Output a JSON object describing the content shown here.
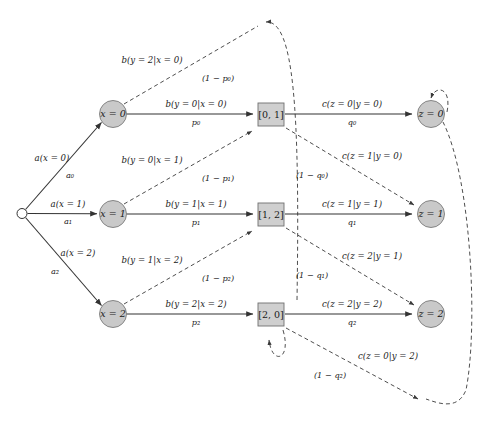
{
  "figure": {
    "title": "",
    "type": "trellis-transition-diagram"
  },
  "nodes": {
    "start": {
      "name": "start-node",
      "label": "",
      "cx": 22,
      "cy": 213.5,
      "r": 5
    },
    "states": [
      {
        "id": "x0",
        "label": "x = 0",
        "cx": 113,
        "cy": 114,
        "r": 13.5
      },
      {
        "id": "x1",
        "label": "x = 1",
        "cx": 113,
        "cy": 214,
        "r": 13.5
      },
      {
        "id": "x2",
        "label": "x = 2",
        "cx": 113,
        "cy": 314,
        "r": 13.5
      }
    ],
    "boxes": [
      {
        "id": "b01",
        "label": "[0, 1]",
        "x": 258,
        "y": 103,
        "w": 26,
        "h": 23
      },
      {
        "id": "b12",
        "label": "[1, 2]",
        "x": 258,
        "y": 203,
        "w": 26,
        "h": 23
      },
      {
        "id": "b20",
        "label": "[2, 0]",
        "x": 258,
        "y": 303,
        "w": 26,
        "h": 23
      }
    ],
    "outputs": [
      {
        "id": "z0",
        "label": "z = 0",
        "cx": 431,
        "cy": 114,
        "r": 13.5
      },
      {
        "id": "z1",
        "label": "z = 1",
        "cx": 431,
        "cy": 214,
        "r": 13.5
      },
      {
        "id": "z2",
        "label": "z = 2",
        "cx": 431,
        "cy": 314,
        "r": 13.5
      }
    ]
  },
  "edges": {
    "prior": [
      {
        "id": "a0",
        "top": "a(x = 0)",
        "bottom": "a₀",
        "top_x": 52,
        "top_y": 158,
        "bot_x": 70,
        "bot_y": 176
      },
      {
        "id": "a1",
        "top": "a(x = 1)",
        "bottom": "a₁",
        "top_x": 68,
        "top_y": 204,
        "bot_x": 68,
        "bot_y": 222
      },
      {
        "id": "a2",
        "top": "a(x = 2)",
        "bottom": "a₂",
        "top_x": 78,
        "top_y": 253,
        "bot_x": 55,
        "bot_y": 272
      }
    ],
    "emission_solid": [
      {
        "id": "b_y0_x0",
        "top": "b(y = 0|x = 0)",
        "bottom": "p₀",
        "top_x": 196,
        "top_y": 104,
        "bot_x": 196,
        "bot_y": 123
      },
      {
        "id": "b_y1_x1",
        "top": "b(y = 1|x = 1)",
        "bottom": "p₁",
        "top_x": 196,
        "top_y": 204,
        "bot_x": 196,
        "bot_y": 223
      },
      {
        "id": "b_y2_x2",
        "top": "b(y = 2|x = 2)",
        "bottom": "p₂",
        "top_x": 196,
        "top_y": 304,
        "bot_x": 196,
        "bot_y": 323
      }
    ],
    "emission_dashed": [
      {
        "id": "b_y2_x0",
        "top": "b(y = 2|x = 0)",
        "bottom": "(1 − p₀)",
        "top_x": 152,
        "top_y": 60,
        "bot_x": 218,
        "bot_y": 79
      },
      {
        "id": "b_y0_x1",
        "top": "b(y = 0|x = 1)",
        "bottom": "(1 − p₁)",
        "top_x": 152,
        "top_y": 160,
        "bot_x": 218,
        "bot_y": 179
      },
      {
        "id": "b_y1_x2",
        "top": "b(y = 1|x = 2)",
        "bottom": "(1 − p₂)",
        "top_x": 152,
        "top_y": 260,
        "bot_x": 218,
        "bot_y": 279
      }
    ],
    "decode_solid": [
      {
        "id": "c_z0_y0",
        "top": "c(z = 0|y = 0)",
        "bottom": "q₀",
        "top_x": 352,
        "top_y": 104,
        "bot_x": 352,
        "bot_y": 123
      },
      {
        "id": "c_z1_y1",
        "top": "c(z = 1|y = 1)",
        "bottom": "q₁",
        "top_x": 352,
        "top_y": 204,
        "bot_x": 352,
        "bot_y": 223
      },
      {
        "id": "c_z2_y2",
        "top": "c(z = 2|y = 2)",
        "bottom": "q₂",
        "top_x": 352,
        "top_y": 304,
        "bot_x": 352,
        "bot_y": 323
      }
    ],
    "decode_dashed": [
      {
        "id": "c_z1_y0",
        "top": "c(z = 1|y = 0)",
        "bottom": "(1 − q₀)",
        "top_x": 372,
        "top_y": 156,
        "bot_x": 312,
        "bot_y": 176
      },
      {
        "id": "c_z2_y1",
        "top": "c(z = 2|y = 1)",
        "bottom": "(1 − q₁)",
        "top_x": 372,
        "top_y": 256,
        "bot_x": 312,
        "bot_y": 276
      },
      {
        "id": "c_z0_y2",
        "top": "c(z = 0|y = 2)",
        "bottom": "(1 − q₂)",
        "top_x": 388,
        "top_y": 356,
        "bot_x": 330,
        "bot_y": 376
      }
    ]
  },
  "colors": {
    "node_fill": "#c9c9c9",
    "node_stroke": "#7a7a7a",
    "box_fill": "#cfcfcf",
    "box_stroke": "#6f6f6f",
    "solid_edge": "#333333",
    "dashed_edge": "#3a3a3a",
    "background": "#ffffff",
    "text": "#1a1a1a"
  }
}
